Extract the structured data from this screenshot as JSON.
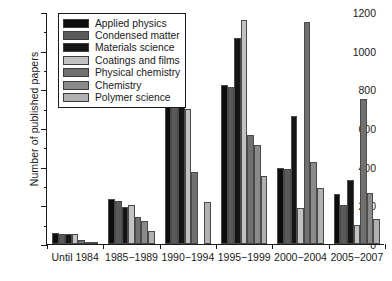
{
  "chart_data": {
    "type": "bar",
    "title": "",
    "xlabel": "",
    "ylabel": "Number of published papers",
    "ylim": [
      0,
      1200
    ],
    "ytick_step": 200,
    "yminor_step": 100,
    "ytick_labels": [
      "0",
      "200",
      "400",
      "600",
      "800",
      "1000",
      "1200"
    ],
    "grid": false,
    "legend_position": "top-left",
    "categories": [
      "Until 1984",
      "1985−1989",
      "1990−1994",
      "1995−1999",
      "2000−2004",
      "2005−2007"
    ],
    "series": [
      {
        "name": "Applied physics",
        "color": "#0d0d0d",
        "values": [
          57,
          235,
          908,
          820,
          393,
          258
        ]
      },
      {
        "name": "Condensed matter",
        "color": "#5a5a5a",
        "values": [
          53,
          222,
          822,
          812,
          390,
          203
        ]
      },
      {
        "name": "Materials science",
        "color": "#151515",
        "values": [
          51,
          190,
          862,
          1065,
          663,
          330
        ]
      },
      {
        "name": "Coatings and films",
        "color": "#c2c2c2",
        "values": [
          51,
          203,
          700,
          1160,
          187,
          97
        ]
      },
      {
        "name": "Physical chemistry",
        "color": "#707070",
        "values": [
          22,
          138,
          375,
          563,
          1148,
          752
        ]
      },
      {
        "name": "Chemistry",
        "color": "#8a8a8a",
        "values": [
          4,
          120,
          0,
          512,
          425,
          265
        ]
      },
      {
        "name": "Polymer science",
        "color": "#b0b0b0",
        "values": [
          2,
          65,
          217,
          352,
          288,
          127
        ]
      }
    ]
  }
}
